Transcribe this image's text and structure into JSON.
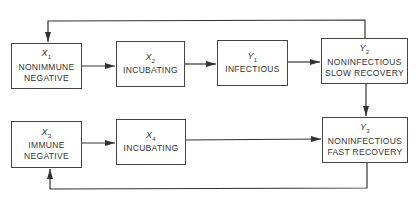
{
  "diagram": {
    "type": "state-transition",
    "nodes": [
      {
        "id": "x1",
        "symbol": "X",
        "sub": "1",
        "line1": "NONIMMUNE",
        "line2": "NEGATIVE"
      },
      {
        "id": "x2",
        "symbol": "X",
        "sub": "2",
        "line1": "INCUBATING",
        "line2": ""
      },
      {
        "id": "y1",
        "symbol": "Y",
        "sub": "1",
        "line1": "INFECTIOUS",
        "line2": ""
      },
      {
        "id": "y2",
        "symbol": "Y",
        "sub": "2",
        "line1": "NONINFECTIOUS",
        "line2": "SLOW RECOVERY"
      },
      {
        "id": "x3",
        "symbol": "X",
        "sub": "3",
        "line1": "IMMUNE",
        "line2": "NEGATIVE"
      },
      {
        "id": "x4",
        "symbol": "X",
        "sub": "4",
        "line1": "INCUBATING",
        "line2": ""
      },
      {
        "id": "y3",
        "symbol": "Y",
        "sub": "3",
        "line1": "NONINFECTIOUS",
        "line2": "FAST RECOVERY"
      }
    ],
    "edges": [
      {
        "from": "x1",
        "to": "x2"
      },
      {
        "from": "x2",
        "to": "y1"
      },
      {
        "from": "y1",
        "to": "y2"
      },
      {
        "from": "y2",
        "to": "x1"
      },
      {
        "from": "y2",
        "to": "y3"
      },
      {
        "from": "x3",
        "to": "x4"
      },
      {
        "from": "x4",
        "to": "y3"
      },
      {
        "from": "y3",
        "to": "x3"
      }
    ],
    "colors": {
      "line": "#333333",
      "border": "#444444",
      "text": "#333333"
    }
  }
}
